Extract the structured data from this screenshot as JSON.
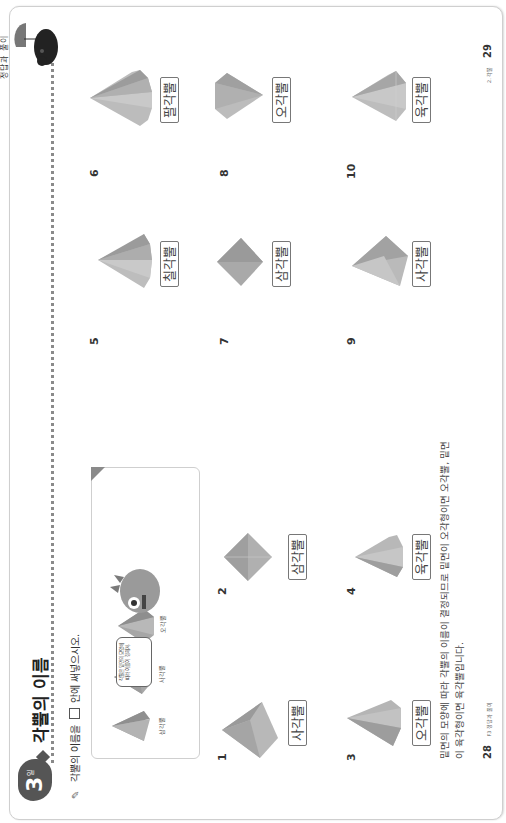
{
  "page": {
    "rotation_deg": -90,
    "edge_text": "정답과 풀이"
  },
  "header": {
    "day_number": "3",
    "day_label": "일",
    "title": "각뿔의 이름"
  },
  "instruction": {
    "icon": "pencil-icon",
    "before_box": "각뿔의 이름을",
    "after_box": "안에 써넣으시오."
  },
  "example_box": {
    "shapes": [
      {
        "label": "삼각뿔"
      },
      {
        "label": "사각뿔"
      },
      {
        "label": "오각뿔"
      }
    ],
    "speech_bubble": "각뿔은 밑면의 모양에 따라 이름이 정해져."
  },
  "questions": [
    {
      "number": "1",
      "answer": "사각뿔"
    },
    {
      "number": "2",
      "answer": "삼각뿔"
    },
    {
      "number": "3",
      "answer": "오각뿔"
    },
    {
      "number": "4",
      "answer": "육각뿔"
    },
    {
      "number": "5",
      "answer": "칠각뿔"
    },
    {
      "number": "6",
      "answer": "팔각뿔"
    },
    {
      "number": "7",
      "answer": "삼각뿔"
    },
    {
      "number": "8",
      "answer": "오각뿔"
    },
    {
      "number": "9",
      "answer": "사각뿔"
    },
    {
      "number": "10",
      "answer": "육각뿔"
    }
  ],
  "explanation": {
    "line1": "밑면의 모양에 따라 각뿔의 이름이 결정되므로 밑면이 오각형이면 오각뿔, 밑면",
    "line2": "이 육각형이면 육각뿔입니다."
  },
  "footer": {
    "left_page": "28",
    "left_label": "F3 정답과 풀이",
    "right_label": "2. 각뿔",
    "right_page": "29"
  },
  "colors": {
    "badge": "#555555",
    "frame_border": "#cfcfcf",
    "shape_dark": "#9a9a9a",
    "shape_light": "#c4c4c4",
    "dots": "#8a8a8a"
  }
}
